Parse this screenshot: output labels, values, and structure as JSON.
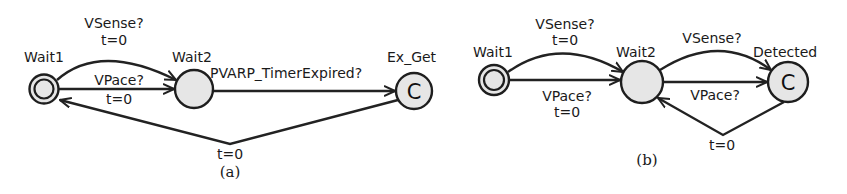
{
  "diagram_a": {
    "caption": "(a)",
    "states": {
      "wait1": {
        "name": "Wait1",
        "type": "initial"
      },
      "wait2": {
        "name": "Wait2",
        "type": "normal"
      },
      "ex_get": {
        "name": "Ex_Get",
        "type": "committed",
        "marker": "C"
      }
    },
    "edges": {
      "wait1_wait2_sense": {
        "sync": "VSense?",
        "update": "t=0"
      },
      "wait1_wait2_pace": {
        "sync": "VPace?",
        "update": "t=0"
      },
      "wait2_exget": {
        "sync": "PVARP_TimerExpired?"
      },
      "exget_wait1": {
        "update": "t=0"
      }
    }
  },
  "diagram_b": {
    "caption": "(b)",
    "states": {
      "wait1": {
        "name": "Wait1",
        "type": "initial"
      },
      "wait2": {
        "name": "Wait2",
        "type": "normal"
      },
      "detected": {
        "name": "Detected",
        "type": "committed",
        "marker": "C"
      }
    },
    "edges": {
      "wait1_wait2_sense": {
        "sync": "VSense?",
        "update": "t=0"
      },
      "wait1_wait2_pace": {
        "sync": "VPace?",
        "update": "t=0"
      },
      "wait2_detected_sense": {
        "sync": "VSense?"
      },
      "wait2_detected_pace": {
        "sync": "VPace?"
      },
      "detected_wait2": {
        "update": "t=0"
      }
    }
  },
  "colors": {
    "state_fill": "#e6e6e6",
    "stroke": "#1e1e1e",
    "background": "#ffffff"
  }
}
